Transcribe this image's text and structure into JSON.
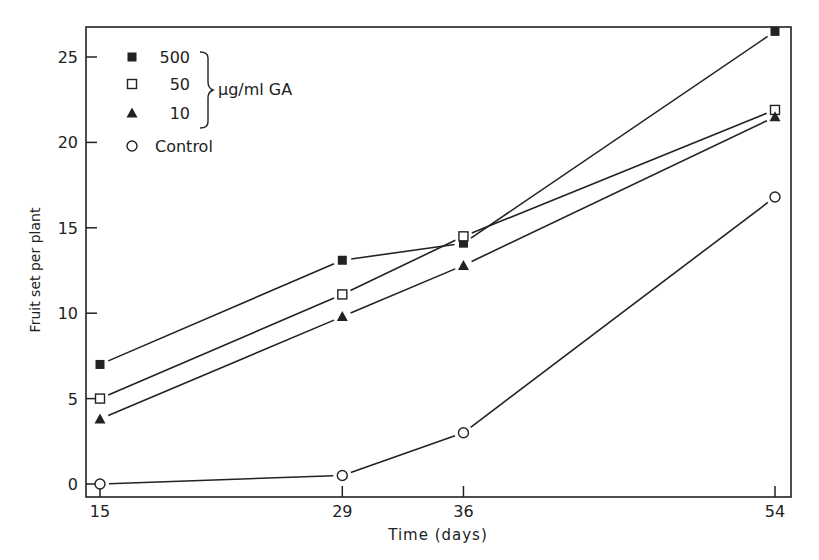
{
  "chart_data": {
    "type": "line",
    "title": "",
    "xlabel": "Time (days)",
    "ylabel": "Fruit set per plant",
    "x": [
      15,
      29,
      36,
      54
    ],
    "x_ticks": [
      15,
      29,
      36,
      54
    ],
    "y_ticks": [
      0,
      5,
      10,
      15,
      20,
      25
    ],
    "xlim": [
      14.3,
      55
    ],
    "ylim": [
      -0.8,
      26.7
    ],
    "grid": false,
    "legend_position": "upper-left",
    "legend_group_label": "µg/ml GA",
    "series": [
      {
        "name": "500",
        "marker": "filled-square",
        "values": [
          7.0,
          13.1,
          14.1,
          26.5
        ]
      },
      {
        "name": "50",
        "marker": "open-square",
        "values": [
          5.0,
          11.1,
          14.5,
          21.9
        ]
      },
      {
        "name": "10",
        "marker": "filled-triangle",
        "values": [
          3.8,
          9.8,
          12.8,
          21.5
        ]
      },
      {
        "name": "Control",
        "marker": "open-circle",
        "values": [
          0.0,
          0.5,
          3.0,
          16.8
        ]
      }
    ]
  }
}
